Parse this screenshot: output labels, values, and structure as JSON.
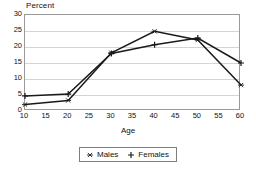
{
  "chart_data": {
    "type": "line",
    "title": "",
    "ylabel": "Percent",
    "xlabel": "Age",
    "x": [
      10,
      20,
      30,
      40,
      50,
      60
    ],
    "xlim": [
      10,
      60
    ],
    "ylim": [
      0,
      30
    ],
    "xticks": [
      10,
      15,
      20,
      25,
      30,
      35,
      40,
      45,
      50,
      55,
      60
    ],
    "yticks": [
      0,
      5,
      10,
      15,
      20,
      25,
      30
    ],
    "grid": "horizontal",
    "legend_position": "bottom-center",
    "series": [
      {
        "name": "Males",
        "marker": "asterisk",
        "color": "#1a1a1a",
        "values": [
          2.0,
          3.3,
          18.2,
          24.9,
          22.2,
          8.1
        ]
      },
      {
        "name": "Females",
        "marker": "plus",
        "color": "#1a1a1a",
        "values": [
          4.7,
          5.3,
          18.0,
          20.7,
          22.8,
          15.0
        ]
      }
    ]
  },
  "legend": {
    "items": [
      {
        "label": "Males",
        "marker": "asterisk-marker-icon"
      },
      {
        "label": "Females",
        "marker": "plus-marker-icon"
      }
    ]
  }
}
